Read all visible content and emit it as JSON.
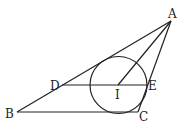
{
  "diagram": {
    "stroke_color": "#222222",
    "points": {
      "A": {
        "label": "A",
        "x": 171,
        "y": 21
      },
      "B": {
        "label": "B",
        "x": 17,
        "y": 112
      },
      "C": {
        "label": "C",
        "x": 138,
        "y": 112
      },
      "D": {
        "label": "D",
        "x": 62,
        "y": 85
      },
      "E": {
        "label": "E",
        "x": 147,
        "y": 85
      },
      "I": {
        "label": "I",
        "x": 118,
        "y": 85
      }
    },
    "circle": {
      "center": "I",
      "cx": 118.5,
      "cy": 85,
      "r": 28.5
    },
    "segments": [
      "AB",
      "BC",
      "CA",
      "DE",
      "AI"
    ]
  }
}
